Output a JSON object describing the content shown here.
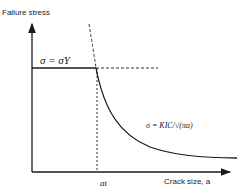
{
  "y_axis_label": "Failure stress",
  "x_axis_label": "Crack size, a",
  "yield_label": "σ = σY",
  "fracture_label": "σ = KIC/√(πa)",
  "transition_label": "at",
  "colors": {
    "line": "#1a1a1a",
    "dashed": "#333333",
    "background": "#ffffff"
  }
}
